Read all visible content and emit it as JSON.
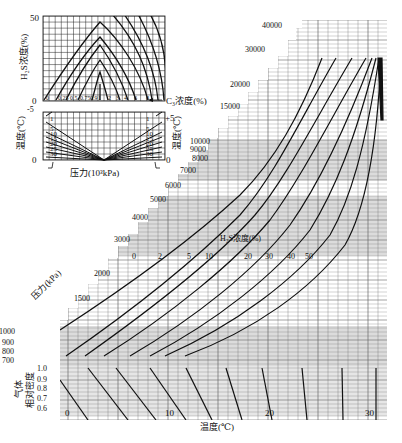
{
  "chart_data": {
    "type": "line",
    "title": "",
    "colors": {
      "line": "#111111",
      "grid": "#555555",
      "shade": "#d9d9d9",
      "background": "#ffffff"
    },
    "main": {
      "xlabel": "温度(℃)",
      "xticks": [
        "0",
        "10",
        "20",
        "30"
      ],
      "xlim": [
        -2,
        32
      ],
      "pressure_axis_label": "压力(kPa)",
      "pressure_ticks": [
        "800",
        "900",
        "1000",
        "1500",
        "2000",
        "3000",
        "4000",
        "5000",
        "6000",
        "7000",
        "8000",
        "9000",
        "10000",
        "15000",
        "20000",
        "30000",
        "40000"
      ],
      "series_label": "H₂S浓度(%)",
      "series": [
        {
          "name": "0",
          "h2s_percent": 0
        },
        {
          "name": "2",
          "h2s_percent": 2
        },
        {
          "name": "5",
          "h2s_percent": 5
        },
        {
          "name": "10",
          "h2s_percent": 10
        },
        {
          "name": "20",
          "h2s_percent": 20
        },
        {
          "name": "30",
          "h2s_percent": 30
        },
        {
          "name": "40",
          "h2s_percent": 40
        },
        {
          "name": "50",
          "h2s_percent": 50
        }
      ],
      "pressure_labels_extra": [
        "700"
      ]
    },
    "gas_density": {
      "ylabel": "气体相对密度",
      "yticks": [
        "0.6",
        "0.7",
        "0.8",
        "0.9",
        "1.0"
      ]
    },
    "inset_top": {
      "ylabel": "H₂S浓度(%)",
      "yticks": [
        "0",
        "50"
      ],
      "xlabel": "C₃浓度(%)",
      "c3_ticks": [
        "0",
        "0.25",
        "0.5",
        "0.75",
        "0.9",
        "1",
        "2",
        "3",
        "4",
        "6",
        "8"
      ],
      "ylim": [
        0,
        50
      ]
    },
    "inset_bottom": {
      "xlabel": "压力(10³kPa)",
      "left_ylabel": "温度(℃)",
      "right_ylabel": "温度(℃)",
      "left_ticks": [
        "-5",
        "0"
      ],
      "right_ticks": [
        "+5",
        "0"
      ],
      "fan_labels": [
        "1",
        "5",
        "10",
        "15",
        "20",
        "25",
        "30"
      ]
    }
  }
}
